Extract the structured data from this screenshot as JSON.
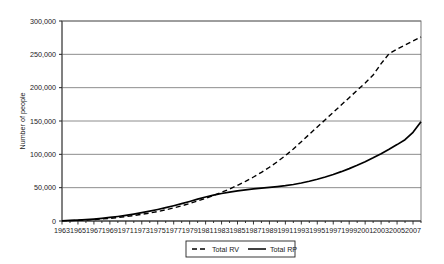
{
  "chart_data": {
    "type": "line",
    "title": "",
    "xlabel": "",
    "ylabel": "Number of people",
    "xlim": [
      1963,
      2008
    ],
    "ylim": [
      0,
      300000
    ],
    "grid": true,
    "grid_axis": "y",
    "legend_position": "bottom-center",
    "x_tick_labels": [
      "1963",
      "1965",
      "1967",
      "1969",
      "1991",
      "1993",
      "1995",
      "1997",
      "1999",
      "2001",
      "2003",
      "2005",
      "2007"
    ],
    "x_ticks": [
      1963,
      1965,
      1967,
      1969,
      1991,
      1993,
      1995,
      1997,
      1999,
      2001,
      2003,
      2005,
      2007
    ],
    "y_tick_labels": [
      "0",
      "50,000",
      "100,000",
      "150,000",
      "200,000",
      "250,000",
      "300,000"
    ],
    "y_ticks": [
      0,
      50000,
      100000,
      150000,
      200000,
      250000,
      300000
    ],
    "x": [
      1963,
      1964,
      1965,
      1966,
      1967,
      1968,
      1969,
      1970,
      1971,
      1972,
      1973,
      1974,
      1975,
      1976,
      1977,
      1978,
      1979,
      1980,
      1981,
      1982,
      1983,
      1984,
      1985,
      1986,
      1987,
      1988,
      1989,
      1990,
      1991,
      1992,
      1993,
      1994,
      1995,
      1996,
      1997,
      1998,
      1999,
      2000,
      2001,
      2002,
      2003,
      2004,
      2005,
      2006,
      2007,
      2008
    ],
    "series": [
      {
        "name": "Total RV",
        "style": "dashed",
        "color": "#000000",
        "values": [
          300,
          600,
          1000,
          1500,
          2200,
          3000,
          4000,
          5200,
          6600,
          8200,
          10000,
          12000,
          14200,
          16800,
          19600,
          22800,
          26200,
          30000,
          34000,
          38400,
          43000,
          48000,
          53600,
          59600,
          66000,
          73000,
          80600,
          89000,
          98000,
          108000,
          119000,
          130000,
          141000,
          152000,
          163000,
          174000,
          185000,
          196000,
          207000,
          219000,
          236000,
          251000,
          258000,
          264000,
          270000,
          276000
        ]
      },
      {
        "name": "Total RP",
        "style": "solid",
        "color": "#000000",
        "values": [
          400,
          800,
          1300,
          2000,
          2900,
          4000,
          5300,
          6800,
          8500,
          10400,
          12500,
          14800,
          17300,
          20000,
          22900,
          26000,
          29300,
          32800,
          36000,
          38800,
          41200,
          43300,
          45100,
          46700,
          48100,
          49300,
          50400,
          51600,
          53000,
          54800,
          57000,
          59600,
          62600,
          66000,
          69800,
          74000,
          78600,
          83600,
          89000,
          94800,
          101000,
          107600,
          114600,
          122000,
          133000,
          149000
        ]
      }
    ]
  },
  "legend": {
    "items": [
      {
        "label": "Total RV",
        "style": "dashed"
      },
      {
        "label": "Total RP",
        "style": "solid"
      }
    ]
  },
  "axes": {
    "y_title": "Number of people"
  }
}
